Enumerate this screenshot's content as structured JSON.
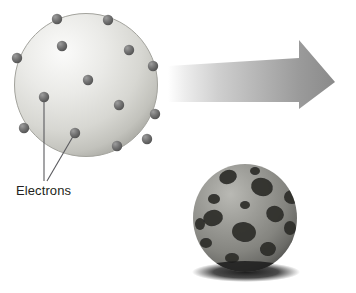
{
  "figure": {
    "background_color": "#ffffff"
  },
  "atom_diagram": {
    "name": "schematic-atom-sphere",
    "sphere": {
      "center_x": 86,
      "center_y": 85,
      "radius": 72,
      "fill_light": "#f2f2f0",
      "fill_mid": "#d8d8d4",
      "fill_dark": "#b4b4ae",
      "outline_color": "#9a9a94"
    },
    "electron_color": "#6d6d6d",
    "electron_highlight": "#9a9a9a",
    "electron_radius": 5.2,
    "electrons": [
      {
        "x": 57,
        "y": 19
      },
      {
        "x": 108,
        "y": 20
      },
      {
        "x": 62,
        "y": 46
      },
      {
        "x": 129,
        "y": 50
      },
      {
        "x": 17,
        "y": 58
      },
      {
        "x": 153,
        "y": 66
      },
      {
        "x": 88,
        "y": 80
      },
      {
        "x": 119,
        "y": 105
      },
      {
        "x": 44,
        "y": 97
      },
      {
        "x": 155,
        "y": 114
      },
      {
        "x": 24,
        "y": 128
      },
      {
        "x": 75,
        "y": 133
      },
      {
        "x": 117,
        "y": 146
      },
      {
        "x": 147,
        "y": 139
      }
    ],
    "leader_lines": [
      {
        "from_x": 44,
        "from_y": 97,
        "to_x": 44,
        "to_y": 181
      },
      {
        "from_x": 75,
        "from_y": 133,
        "to_x": 47,
        "to_y": 181
      }
    ],
    "leader_color": "#55555a",
    "label": "Electrons"
  },
  "arrow": {
    "name": "transformation-arrow",
    "tail_color": "#ffffff",
    "head_color": "#8a8a8a",
    "mid_color": "#b8b8b8",
    "tip_x": 335,
    "tip_y": 82,
    "shaft_top_y": 64,
    "shaft_bottom_y": 101,
    "head_top_y": 57,
    "head_bottom_y": 109,
    "head_start_x": 299,
    "tail_x": 168
  },
  "ball_photo": {
    "name": "physical-ball-model",
    "body_color": "#8f8f8c",
    "body_light": "#b4b4b0",
    "body_dark": "#62625f",
    "spot_color": "#2a2a28",
    "shadow_color": "#1a1a1a",
    "center_x": 245,
    "center_y": 218,
    "radius_x": 52,
    "radius_y": 54,
    "spots": [
      {
        "x": 228,
        "y": 177,
        "rx": 9,
        "ry": 7,
        "rot": -20
      },
      {
        "x": 262,
        "y": 187,
        "rx": 11,
        "ry": 9,
        "rot": 15
      },
      {
        "x": 292,
        "y": 197,
        "rx": 8,
        "ry": 7,
        "rot": 0
      },
      {
        "x": 214,
        "y": 199,
        "rx": 6,
        "ry": 5,
        "rot": 0
      },
      {
        "x": 245,
        "y": 205,
        "rx": 5,
        "ry": 4,
        "rot": 0
      },
      {
        "x": 275,
        "y": 214,
        "rx": 9,
        "ry": 8,
        "rot": 25
      },
      {
        "x": 213,
        "y": 218,
        "rx": 10,
        "ry": 8,
        "rot": -15
      },
      {
        "x": 244,
        "y": 232,
        "rx": 12,
        "ry": 10,
        "rot": 10
      },
      {
        "x": 290,
        "y": 228,
        "rx": 6,
        "ry": 7,
        "rot": 0
      },
      {
        "x": 206,
        "y": 243,
        "rx": 6,
        "ry": 5,
        "rot": 0
      },
      {
        "x": 268,
        "y": 249,
        "rx": 8,
        "ry": 7,
        "rot": -10
      },
      {
        "x": 232,
        "y": 258,
        "rx": 7,
        "ry": 5,
        "rot": 0
      },
      {
        "x": 296,
        "y": 244,
        "rx": 5,
        "ry": 6,
        "rot": 0
      },
      {
        "x": 255,
        "y": 171,
        "rx": 5,
        "ry": 4,
        "rot": 0
      },
      {
        "x": 200,
        "y": 224,
        "rx": 5,
        "ry": 6,
        "rot": 0
      }
    ]
  }
}
